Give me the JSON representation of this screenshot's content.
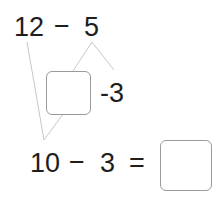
{
  "problem": {
    "top_expression": {
      "minuend": "12",
      "operator": "−",
      "subtrahend": "5"
    },
    "split": {
      "blank_box": "",
      "remainder": "-3"
    },
    "bottom_expression": {
      "minuend": "10",
      "operator": "−",
      "subtrahend": "3",
      "equals": "=",
      "answer_box": ""
    }
  },
  "colors": {
    "text": "#1e1e1e",
    "lines": "#c8c8c8",
    "box_border": "#9a9a9a"
  }
}
